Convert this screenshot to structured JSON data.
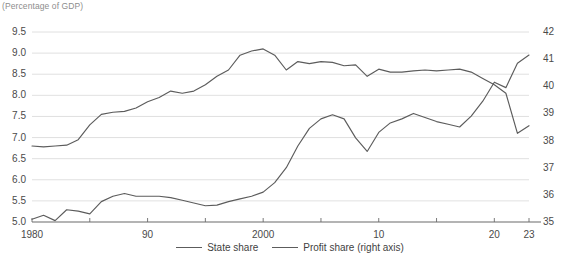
{
  "chart_data": {
    "type": "line",
    "title": "",
    "unit_note": "(Percentage of GDP)",
    "xlabel": "",
    "ylabel": "",
    "grid": true,
    "legend_position": "bottom",
    "x": [
      1980,
      1981,
      1982,
      1983,
      1984,
      1985,
      1986,
      1987,
      1988,
      1989,
      1990,
      1991,
      1992,
      1993,
      1994,
      1995,
      1996,
      1997,
      1998,
      1999,
      2000,
      2001,
      2002,
      2003,
      2004,
      2005,
      2006,
      2007,
      2008,
      2009,
      2010,
      2011,
      2012,
      2013,
      2014,
      2015,
      2016,
      2017,
      2018,
      2019,
      2020,
      2021,
      2022,
      2023
    ],
    "x_tick_values": [
      1980,
      1990,
      2000,
      2010,
      2020,
      2023
    ],
    "x_tick_labels": [
      "1980",
      "90",
      "2000",
      "10",
      "20",
      "23"
    ],
    "xlim": [
      1980,
      2023
    ],
    "axes": [
      {
        "id": "left",
        "side": "left",
        "ylim": [
          5.0,
          9.5
        ],
        "tick_values": [
          5.0,
          5.5,
          6.0,
          6.5,
          7.0,
          7.5,
          8.0,
          8.5,
          9.0,
          9.5
        ],
        "tick_labels": [
          "5.0",
          "5.5",
          "6.0",
          "6.5",
          "7.0",
          "7.5",
          "8.0",
          "8.5",
          "9.0",
          "9.5"
        ]
      },
      {
        "id": "right",
        "side": "right",
        "ylim": [
          35,
          42
        ],
        "tick_values": [
          35,
          36,
          37,
          38,
          39,
          40,
          41,
          42
        ],
        "tick_labels": [
          "35",
          "36",
          "37",
          "38",
          "39",
          "40",
          "41",
          "42"
        ]
      }
    ],
    "series": [
      {
        "name": "State share",
        "axis": "left",
        "color": "#5c5c5c",
        "values": [
          6.8,
          6.78,
          6.8,
          6.82,
          6.95,
          7.3,
          7.55,
          7.6,
          7.62,
          7.7,
          7.85,
          7.95,
          8.1,
          8.05,
          8.1,
          8.25,
          8.45,
          8.6,
          8.95,
          9.05,
          9.1,
          8.95,
          8.6,
          8.8,
          8.75,
          8.8,
          8.78,
          8.7,
          8.72,
          8.45,
          8.62,
          8.55,
          8.55,
          8.58,
          8.6,
          8.58,
          8.6,
          8.62,
          8.55,
          8.4,
          8.25,
          8.05,
          7.1,
          7.28
        ]
      },
      {
        "name": "Profit share (right axis)",
        "axis": "right",
        "color": "#5c5c5c",
        "values": [
          35.1,
          35.25,
          35.05,
          35.45,
          35.4,
          35.3,
          35.75,
          35.95,
          36.05,
          35.95,
          35.95,
          35.95,
          35.9,
          35.8,
          35.7,
          35.6,
          35.62,
          35.75,
          35.85,
          35.95,
          36.1,
          36.45,
          37.0,
          37.8,
          38.45,
          38.8,
          38.95,
          38.8,
          38.1,
          37.6,
          38.3,
          38.65,
          38.8,
          39.0,
          38.85,
          38.7,
          38.6,
          38.5,
          38.9,
          39.45,
          40.15,
          39.95,
          40.85,
          41.15
        ]
      }
    ],
    "legend": [
      {
        "label": "State share"
      },
      {
        "label": "Profit share (right axis)"
      }
    ]
  }
}
